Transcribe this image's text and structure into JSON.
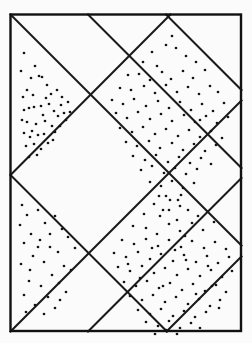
{
  "figure": {
    "title": "Lattice of diagonal lines over a rectangle with scattered dots",
    "canvas": {
      "width": 252,
      "height": 343,
      "background": "#ffffff"
    },
    "colors": {
      "paper": "#fbfbfb",
      "ink": "#1a1a1a",
      "border": "#111111",
      "dot": "#141414"
    },
    "strokes": {
      "border_width": 2.4,
      "lattice_width": 2.0,
      "dot_radius": 1.35
    },
    "frame": {
      "label": "outer-rectangle",
      "x": 10.5,
      "y": 14.5,
      "width": 230.5,
      "height": 316.5
    },
    "lattice": {
      "label": "diagonal-lattice",
      "spacing": 78,
      "vertices": [
        {
          "name": "top-vertex",
          "x": 166,
          "y": 14
        },
        {
          "name": "left-vertex",
          "x": 12,
          "y": 175
        },
        {
          "name": "right-vertex-upper",
          "x": 241,
          "y": 97
        },
        {
          "name": "right-vertex-lower",
          "x": 241,
          "y": 253
        },
        {
          "name": "bottom-vertex",
          "x": 167,
          "y": 331
        },
        {
          "name": "crossing-upper-left",
          "x": 88,
          "y": 97
        },
        {
          "name": "crossing-center",
          "x": 166,
          "y": 175
        },
        {
          "name": "crossing-lower-left",
          "x": 88,
          "y": 253
        }
      ],
      "lines_down_right": [
        {
          "x1": 10.5,
          "y1": 14.5,
          "x2": 241.5,
          "y2": 245.5
        },
        {
          "x1": 10.5,
          "y1": 175.0,
          "x2": 167.0,
          "y2": 331.5
        },
        {
          "x1": 88.0,
          "y1": 14.5,
          "x2": 241.5,
          "y2": 168.0
        },
        {
          "x1": 166.0,
          "y1": 14.5,
          "x2": 241.5,
          "y2": 90.0
        }
      ],
      "lines_up_right": [
        {
          "x1": 10.5,
          "y1": 175.0,
          "x2": 170.5,
          "y2": 14.5
        },
        {
          "x1": 10.5,
          "y1": 331.5,
          "x2": 241.5,
          "y2": 100.5
        },
        {
          "x1": 88.0,
          "y1": 331.5,
          "x2": 241.5,
          "y2": 178.0
        },
        {
          "x1": 166.5,
          "y1": 331.5,
          "x2": 241.5,
          "y2": 256.5
        }
      ]
    },
    "cells": [
      {
        "name": "upper-left-triangle",
        "density": "sparse",
        "dot_count": 46,
        "dots": [
          [
            24,
            53
          ],
          [
            21,
            71
          ],
          [
            35,
            66
          ],
          [
            31,
            78
          ],
          [
            39,
            76
          ],
          [
            42,
            77
          ],
          [
            27,
            90
          ],
          [
            47,
            85
          ],
          [
            23,
            97
          ],
          [
            33,
            95
          ],
          [
            51,
            94
          ],
          [
            57,
            90
          ],
          [
            62,
            97
          ],
          [
            24,
            110
          ],
          [
            29,
            108
          ],
          [
            34,
            107
          ],
          [
            41,
            106
          ],
          [
            49,
            104
          ],
          [
            54,
            111
          ],
          [
            61,
            105
          ],
          [
            68,
            102
          ],
          [
            43,
            115
          ],
          [
            58,
            116
          ],
          [
            64,
            113
          ],
          [
            70,
            112
          ],
          [
            27,
            122
          ],
          [
            36,
            124
          ],
          [
            45,
            121
          ],
          [
            52,
            126
          ],
          [
            66,
            120
          ],
          [
            24,
            133
          ],
          [
            32,
            131
          ],
          [
            30,
            137
          ],
          [
            38,
            135
          ],
          [
            44,
            134
          ],
          [
            55,
            132
          ],
          [
            26,
            146
          ],
          [
            34,
            144
          ],
          [
            41,
            149
          ],
          [
            48,
            143
          ],
          [
            29,
            157
          ],
          [
            37,
            155
          ],
          [
            22,
            120
          ],
          [
            46,
            98
          ],
          [
            60,
            126
          ],
          [
            53,
            140
          ]
        ]
      },
      {
        "name": "upper-right-diamond",
        "density": "dense",
        "dot_count": 92,
        "dots": [
          [
            166,
            45
          ],
          [
            152,
            52
          ],
          [
            176,
            48
          ],
          [
            143,
            62
          ],
          [
            157,
            66
          ],
          [
            186,
            56
          ],
          [
            196,
            62
          ],
          [
            128,
            75
          ],
          [
            139,
            74
          ],
          [
            150,
            80
          ],
          [
            162,
            72
          ],
          [
            171,
            79
          ],
          [
            183,
            71
          ],
          [
            193,
            78
          ],
          [
            205,
            70
          ],
          [
            120,
            88
          ],
          [
            131,
            90
          ],
          [
            144,
            86
          ],
          [
            155,
            93
          ],
          [
            166,
            85
          ],
          [
            177,
            92
          ],
          [
            188,
            87
          ],
          [
            199,
            94
          ],
          [
            210,
            86
          ],
          [
            218,
            92
          ],
          [
            112,
            100
          ],
          [
            123,
            104
          ],
          [
            134,
            99
          ],
          [
            146,
            106
          ],
          [
            158,
            101
          ],
          [
            169,
            108
          ],
          [
            180,
            102
          ],
          [
            191,
            110
          ],
          [
            202,
            104
          ],
          [
            213,
            111
          ],
          [
            224,
            103
          ],
          [
            116,
            113
          ],
          [
            127,
            118
          ],
          [
            138,
            112
          ],
          [
            150,
            119
          ],
          [
            161,
            114
          ],
          [
            172,
            121
          ],
          [
            184,
            115
          ],
          [
            195,
            122
          ],
          [
            206,
            116
          ],
          [
            217,
            123
          ],
          [
            228,
            117
          ],
          [
            120,
            128
          ],
          [
            132,
            132
          ],
          [
            143,
            127
          ],
          [
            155,
            134
          ],
          [
            166,
            129
          ],
          [
            178,
            136
          ],
          [
            189,
            130
          ],
          [
            200,
            137
          ],
          [
            211,
            131
          ],
          [
            222,
            138
          ],
          [
            126,
            142
          ],
          [
            137,
            146
          ],
          [
            149,
            141
          ],
          [
            160,
            148
          ],
          [
            172,
            143
          ],
          [
            183,
            150
          ],
          [
            194,
            144
          ],
          [
            205,
            151
          ],
          [
            216,
            145
          ],
          [
            133,
            156
          ],
          [
            145,
            160
          ],
          [
            156,
            155
          ],
          [
            168,
            162
          ],
          [
            179,
            157
          ],
          [
            190,
            163
          ],
          [
            201,
            158
          ],
          [
            211,
            164
          ],
          [
            141,
            170
          ],
          [
            152,
            166
          ],
          [
            164,
            173
          ],
          [
            175,
            168
          ],
          [
            186,
            174
          ],
          [
            197,
            169
          ],
          [
            150,
            182
          ],
          [
            161,
            186
          ],
          [
            172,
            181
          ],
          [
            183,
            188
          ],
          [
            194,
            183
          ],
          [
            159,
            196
          ],
          [
            170,
            200
          ],
          [
            181,
            195
          ],
          [
            169,
            210
          ],
          [
            180,
            206
          ],
          [
            177,
            220
          ],
          [
            172,
            36
          ],
          [
            200,
            120
          ]
        ]
      },
      {
        "name": "center-diamond",
        "density": "empty",
        "dot_count": 0,
        "dots": []
      },
      {
        "name": "lower-left-triangle",
        "density": "sparse",
        "dot_count": 34,
        "dots": [
          [
            22,
            205
          ],
          [
            27,
            215
          ],
          [
            20,
            225
          ],
          [
            38,
            210
          ],
          [
            45,
            223
          ],
          [
            31,
            234
          ],
          [
            55,
            216
          ],
          [
            62,
            229
          ],
          [
            24,
            243
          ],
          [
            40,
            240
          ],
          [
            50,
            247
          ],
          [
            68,
            237
          ],
          [
            33,
            256
          ],
          [
            58,
            252
          ],
          [
            75,
            248
          ],
          [
            21,
            264
          ],
          [
            44,
            262
          ],
          [
            64,
            266
          ],
          [
            52,
            275
          ],
          [
            71,
            270
          ],
          [
            29,
            281
          ],
          [
            41,
            286
          ],
          [
            59,
            283
          ],
          [
            24,
            295
          ],
          [
            48,
            297
          ],
          [
            66,
            292
          ],
          [
            35,
            305
          ],
          [
            55,
            308
          ],
          [
            26,
            312
          ],
          [
            44,
            314
          ],
          [
            60,
            300
          ],
          [
            30,
            270
          ],
          [
            38,
            247
          ],
          [
            50,
            234
          ]
        ]
      },
      {
        "name": "lower-right-diamond",
        "density": "dense",
        "dot_count": 94,
        "dots": [
          [
            166,
            196
          ],
          [
            154,
            204
          ],
          [
            178,
            200
          ],
          [
            144,
            214
          ],
          [
            160,
            216
          ],
          [
            188,
            210
          ],
          [
            198,
            216
          ],
          [
            133,
            226
          ],
          [
            146,
            228
          ],
          [
            157,
            234
          ],
          [
            169,
            224
          ],
          [
            180,
            231
          ],
          [
            192,
            223
          ],
          [
            203,
            230
          ],
          [
            214,
            222
          ],
          [
            122,
            240
          ],
          [
            134,
            244
          ],
          [
            146,
            239
          ],
          [
            158,
            246
          ],
          [
            169,
            240
          ],
          [
            181,
            247
          ],
          [
            192,
            241
          ],
          [
            204,
            248
          ],
          [
            215,
            242
          ],
          [
            226,
            249
          ],
          [
            114,
            253
          ],
          [
            126,
            257
          ],
          [
            138,
            252
          ],
          [
            150,
            259
          ],
          [
            161,
            254
          ],
          [
            173,
            261
          ],
          [
            184,
            255
          ],
          [
            196,
            262
          ],
          [
            207,
            256
          ],
          [
            218,
            263
          ],
          [
            229,
            257
          ],
          [
            118,
            267
          ],
          [
            130,
            271
          ],
          [
            142,
            266
          ],
          [
            154,
            273
          ],
          [
            165,
            268
          ],
          [
            177,
            275
          ],
          [
            188,
            269
          ],
          [
            200,
            276
          ],
          [
            211,
            270
          ],
          [
            222,
            277
          ],
          [
            232,
            271
          ],
          [
            124,
            282
          ],
          [
            136,
            286
          ],
          [
            147,
            281
          ],
          [
            159,
            288
          ],
          [
            170,
            283
          ],
          [
            182,
            290
          ],
          [
            193,
            284
          ],
          [
            205,
            291
          ],
          [
            216,
            285
          ],
          [
            226,
            292
          ],
          [
            130,
            296
          ],
          [
            142,
            300
          ],
          [
            153,
            295
          ],
          [
            165,
            302
          ],
          [
            176,
            297
          ],
          [
            188,
            304
          ],
          [
            199,
            299
          ],
          [
            210,
            306
          ],
          [
            220,
            300
          ],
          [
            138,
            310
          ],
          [
            150,
            314
          ],
          [
            161,
            309
          ],
          [
            173,
            316
          ],
          [
            184,
            311
          ],
          [
            195,
            317
          ],
          [
            206,
            312
          ],
          [
            146,
            322
          ],
          [
            158,
            326
          ],
          [
            169,
            321
          ],
          [
            180,
            328
          ],
          [
            191,
            323
          ],
          [
            155,
            334
          ],
          [
            166,
            330
          ],
          [
            177,
            334
          ],
          [
            163,
            210
          ],
          [
            185,
            236
          ],
          [
            208,
            266
          ],
          [
            140,
            278
          ],
          [
            175,
            250
          ],
          [
            196,
            294
          ],
          [
            152,
            248
          ],
          [
            128,
            264
          ],
          [
            219,
            308
          ],
          [
            200,
            328
          ],
          [
            186,
            260
          ],
          [
            163,
            286
          ],
          [
            212,
            286
          ]
        ]
      }
    ]
  }
}
